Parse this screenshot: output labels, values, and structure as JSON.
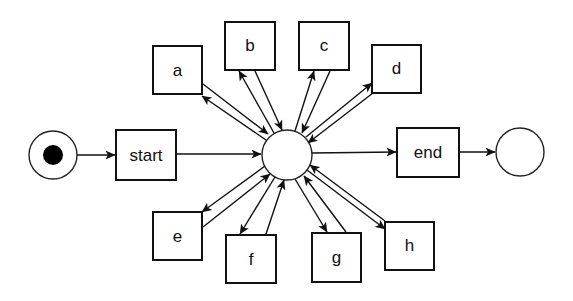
{
  "diagram": {
    "type": "petri-net / workflow net",
    "places": {
      "start_place": {
        "cx": 53,
        "cy": 155,
        "r": 24,
        "token": true
      },
      "center_place": {
        "cx": 287,
        "cy": 155,
        "r": 25,
        "token": false
      },
      "end_place": {
        "cx": 520,
        "cy": 152,
        "r": 24,
        "token": false
      }
    },
    "transitions": {
      "start": {
        "label": "start",
        "x": 116,
        "y": 130,
        "w": 60,
        "h": 50
      },
      "end": {
        "label": "end",
        "x": 397,
        "y": 128,
        "w": 62,
        "h": 49
      },
      "a": {
        "label": "a",
        "x": 153,
        "y": 46,
        "w": 49,
        "h": 48
      },
      "b": {
        "label": "b",
        "x": 225,
        "y": 22,
        "w": 50,
        "h": 48
      },
      "c": {
        "label": "c",
        "x": 299,
        "y": 22,
        "w": 50,
        "h": 48
      },
      "d": {
        "label": "d",
        "x": 372,
        "y": 45,
        "w": 49,
        "h": 48
      },
      "e": {
        "label": "e",
        "x": 153,
        "y": 212,
        "w": 49,
        "h": 48
      },
      "f": {
        "label": "f",
        "x": 226,
        "y": 235,
        "w": 50,
        "h": 48
      },
      "g": {
        "label": "g",
        "x": 312,
        "y": 233,
        "w": 49,
        "h": 49
      },
      "h": {
        "label": "h",
        "x": 385,
        "y": 222,
        "w": 49,
        "h": 48
      }
    },
    "arcs": [
      {
        "from": "start_place",
        "to": "start"
      },
      {
        "from": "start",
        "to": "center_place"
      },
      {
        "from": "center_place",
        "to": "end"
      },
      {
        "from": "end",
        "to": "end_place"
      },
      {
        "from": "center_place",
        "to": "a"
      },
      {
        "from": "a",
        "to": "center_place"
      },
      {
        "from": "center_place",
        "to": "b"
      },
      {
        "from": "b",
        "to": "center_place"
      },
      {
        "from": "center_place",
        "to": "c"
      },
      {
        "from": "c",
        "to": "center_place"
      },
      {
        "from": "center_place",
        "to": "d"
      },
      {
        "from": "d",
        "to": "center_place"
      },
      {
        "from": "center_place",
        "to": "e"
      },
      {
        "from": "e",
        "to": "center_place"
      },
      {
        "from": "center_place",
        "to": "f"
      },
      {
        "from": "f",
        "to": "center_place"
      },
      {
        "from": "center_place",
        "to": "g"
      },
      {
        "from": "g",
        "to": "center_place"
      },
      {
        "from": "center_place",
        "to": "h"
      },
      {
        "from": "h",
        "to": "center_place"
      }
    ]
  }
}
